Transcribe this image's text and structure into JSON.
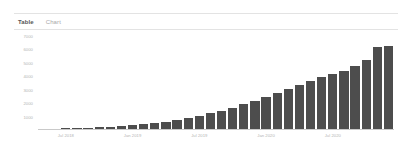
{
  "tabs": [
    {
      "label": "Table",
      "active": false
    },
    {
      "label": "Chart",
      "active": true
    }
  ],
  "colors": {
    "bar": "#4d4d4d",
    "axis": "#c9c9c9",
    "tick_text": "#b4b4b4",
    "tab_active": "#a8a8a8",
    "tab_inactive": "#565656",
    "border": "#e3e3e3",
    "background": "#ffffff"
  },
  "chart_data": {
    "type": "bar",
    "title": "",
    "subtitle": "",
    "xlabel": "",
    "ylabel": "",
    "grid": false,
    "legend": false,
    "ylim": [
      0,
      7000
    ],
    "yticks": [
      "7000",
      "6000",
      "5000",
      "4000",
      "3000",
      "2000",
      "1000"
    ],
    "ytick_values": [
      7000,
      6000,
      5000,
      4000,
      3000,
      2000,
      1000
    ],
    "xticks": [
      "Jul 2018",
      "Jan 2019",
      "Jul 2019",
      "Jan 2020",
      "Jul 2020"
    ],
    "xtick_positions": [
      2,
      8,
      14,
      20,
      26
    ],
    "categories": [
      "May 2018",
      "Jun 2018",
      "Jul 2018",
      "Aug 2018",
      "Sep 2018",
      "Oct 2018",
      "Nov 2018",
      "Dec 2018",
      "Jan 2019",
      "Feb 2019",
      "Mar 2019",
      "Apr 2019",
      "May 2019",
      "Jun 2019",
      "Jul 2019",
      "Aug 2019",
      "Sep 2019",
      "Oct 2019",
      "Nov 2019",
      "Dec 2019",
      "Jan 2020",
      "Feb 2020",
      "Mar 2020",
      "Apr 2020",
      "May 2020",
      "Jun 2020",
      "Jul 2020",
      "Aug 2020",
      "Sep 2020",
      "Oct 2020",
      "Nov 2020",
      "Dec 2020"
    ],
    "values": [
      20,
      30,
      45,
      70,
      95,
      130,
      170,
      220,
      280,
      360,
      450,
      560,
      700,
      850,
      1000,
      1180,
      1380,
      1600,
      1850,
      2100,
      2400,
      2700,
      3000,
      3300,
      3600,
      3900,
      4150,
      4400,
      4750,
      5200,
      6150,
      6250
    ]
  }
}
